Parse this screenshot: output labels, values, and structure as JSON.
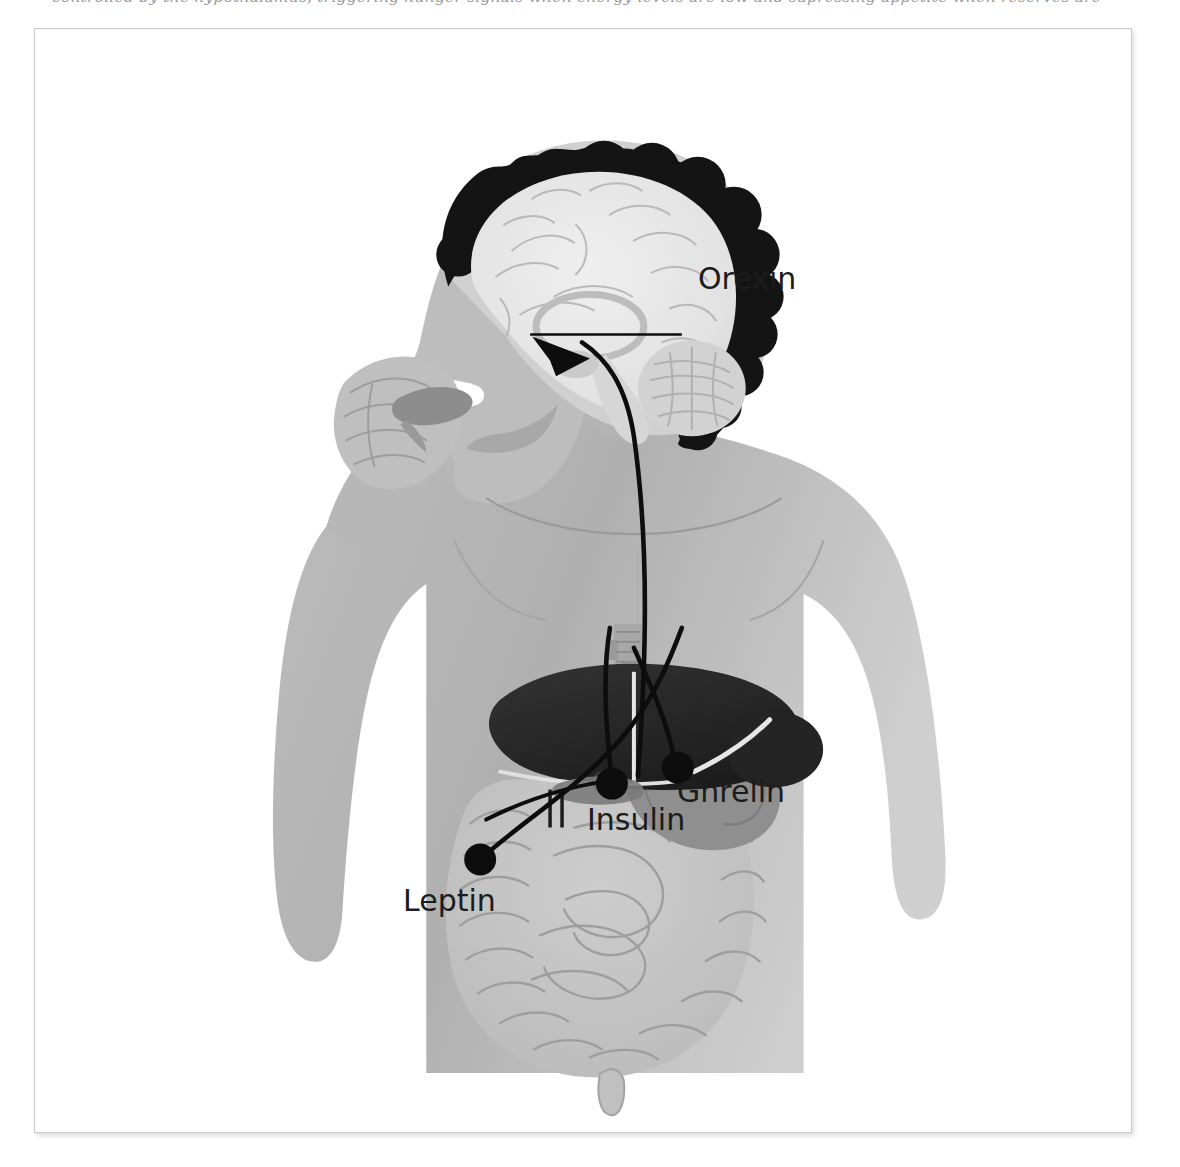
{
  "caption": {
    "fragment_text": "controlled by the hypothalamus, triggering hunger signals when energy levels are low and supressing appetite when reserves are"
  },
  "figure": {
    "frame": {
      "border_color": "#c9c9c9",
      "background": "#ffffff"
    },
    "labels": [
      {
        "id": "orexin",
        "text": "Orexin",
        "has_leader_line": true,
        "marker": "leader-line",
        "origin": "hypothalamus"
      },
      {
        "id": "ghrelin",
        "text": "Ghrelin",
        "has_leader_line": false,
        "marker": "dot",
        "origin": "stomach"
      },
      {
        "id": "insulin",
        "text": "Insulin",
        "has_leader_line": false,
        "marker": "dot",
        "origin": "pancreas"
      },
      {
        "id": "leptin",
        "text": "Leptin",
        "has_leader_line": false,
        "marker": "dot",
        "origin": "adipose-intestine"
      }
    ],
    "anatomy": [
      {
        "id": "body",
        "name": "Human torso silhouette",
        "color": "#b5b5b5"
      },
      {
        "id": "hair",
        "name": "Hair",
        "color": "#1a1a1a"
      },
      {
        "id": "brain",
        "name": "Brain sagittal section",
        "color": "#e4e4e4"
      },
      {
        "id": "cerebellum",
        "name": "Cerebellum",
        "color": "#cfcfcf"
      },
      {
        "id": "hand-food",
        "name": "Hand holding food",
        "color": "#8f8f8f"
      },
      {
        "id": "liver",
        "name": "Liver",
        "color": "#2b2b2b"
      },
      {
        "id": "stomach",
        "name": "Stomach",
        "color": "#8e8e8e"
      },
      {
        "id": "pancreas",
        "name": "Pancreas",
        "color": "#7d7d7d"
      },
      {
        "id": "intestines",
        "name": "Small and large intestines",
        "color": "#c2c2c2"
      },
      {
        "id": "esophagus",
        "name": "Esophagus and trachea",
        "color": "#9d9d9d"
      }
    ],
    "signal_arrow": {
      "target": "hypothalamus",
      "description": "Arrow from abdominal hormone sources to the hypothalamus",
      "color": "#111111"
    },
    "colors": {
      "ink": "#111111",
      "label_text": "#1c1c1c",
      "body_fill": "#b5b5b5",
      "organ_dark": "#2b2b2b",
      "page_background": "#ffffff"
    }
  }
}
